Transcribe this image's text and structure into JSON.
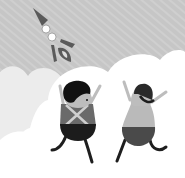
{
  "illustration": {
    "description": "Grayscale cartoon of a rocket flying in a striped sky above clouds with two cheering characters",
    "colors": {
      "sky": "#c6c6c6",
      "sky_stripe": "#d0d0d0",
      "cloud_left": "#ececec",
      "cloud_right": "#ffffff",
      "rocket": "#5a5a5a",
      "rocket_window": "#ffffff",
      "char1_hair": "#111111",
      "char1_face": "#bdbdbd",
      "char1_shirt": "#6a6a6a",
      "char1_straps": "#cfcfcf",
      "char1_pants": "#1c1c1c",
      "char2_hat": "#2a2a2a",
      "char2_face": "#bdbdbd",
      "char2_shirt": "#bababa",
      "char2_pants": "#4a4a4a",
      "limbs": "#1e1e1e",
      "arms": "#bdbdbd"
    }
  }
}
